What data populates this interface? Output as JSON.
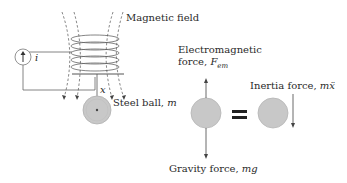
{
  "diagram": {
    "labels": {
      "magnetic_field": "Magnetic field",
      "current_symbol": "i",
      "displacement_symbol": "x",
      "steel_ball": "Steel ball, ",
      "steel_ball_mass": "m",
      "em_force_line1": "Electromagnetic",
      "em_force_line2": "force, ",
      "em_force_symbol": "F",
      "em_force_subscript": "em",
      "inertia_force": "Inertia force, ",
      "inertia_force_symbol": "mẍ",
      "gravity_force": "Gravity force, ",
      "gravity_force_symbol": "mg",
      "equals": "="
    },
    "colors": {
      "line": "#555555",
      "ball_fill": "#c8c8c8",
      "ball_stroke": "#aaaaaa",
      "text": "#2a2a2a",
      "equals": "#222222"
    }
  }
}
